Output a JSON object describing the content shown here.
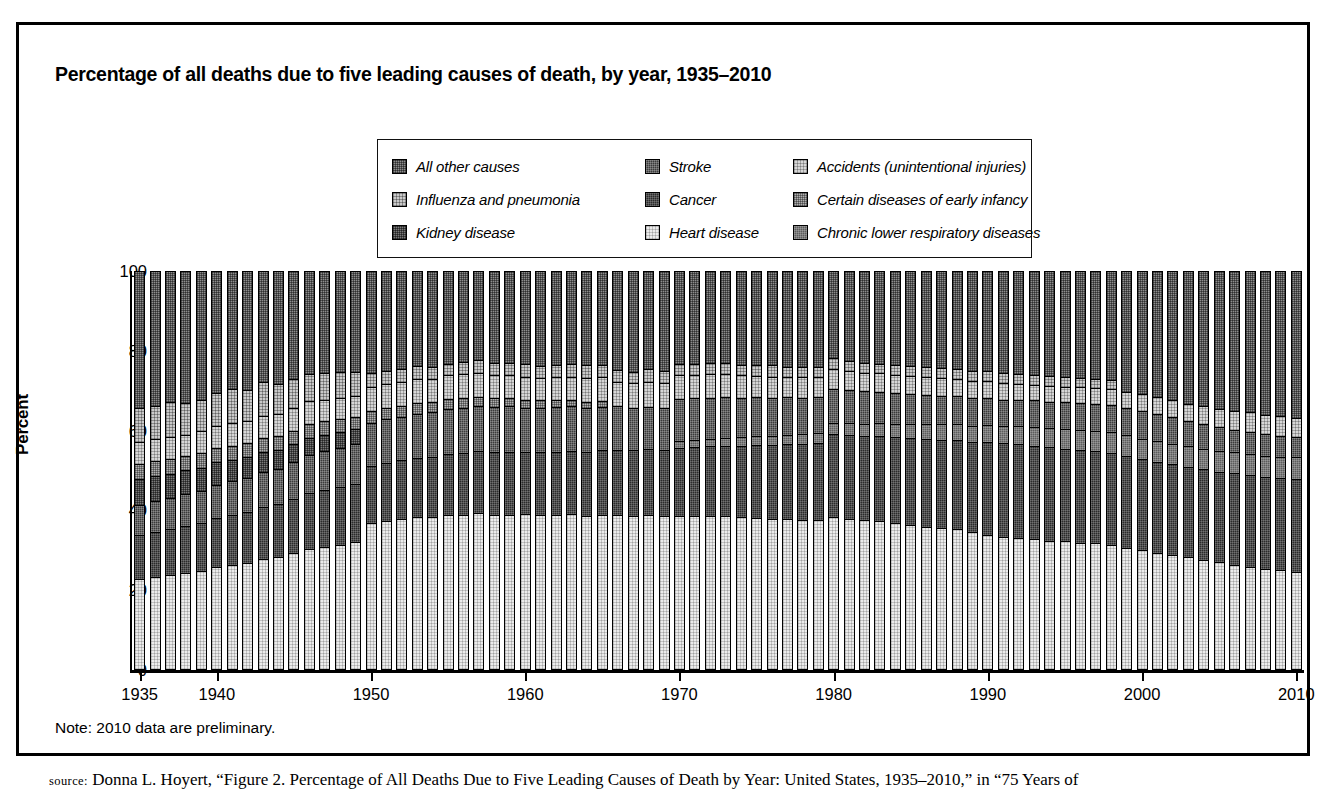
{
  "figure": {
    "title": "Percentage of all deaths due to five leading causes of death, by year, 1935–2010",
    "note": "Note: 2010 data are preliminary.",
    "source_prefix": "source:",
    "source_text": " Donna L. Hoyert, “Figure 2. Percentage of All Deaths Due to Five Leading Causes of Death by Year: United States, 1935–2010,” in “75 Years of",
    "page_header": ""
  },
  "legend": {
    "items": [
      {
        "label": "All other causes",
        "key": "allother",
        "pattern": "p-allother",
        "color": "#8d8d8d"
      },
      {
        "label": "Stroke",
        "key": "stroke",
        "pattern": "p-stroke",
        "color": "#3b3b3b"
      },
      {
        "label": "Accidents (unintentional injuries)",
        "key": "accidents",
        "pattern": "p-accidents",
        "color": "#d6d6d6"
      },
      {
        "label": "Influenza and pneumonia",
        "key": "influenza",
        "pattern": "p-influenza",
        "color": "#c9c9c9"
      },
      {
        "label": "Cancer",
        "key": "cancer",
        "pattern": "p-cancer",
        "color": "#2b2b2b"
      },
      {
        "label": "Certain diseases of early infancy",
        "key": "infancy",
        "pattern": "p-infancy",
        "color": "#b0b0b0"
      },
      {
        "label": "Kidney disease",
        "key": "kidney",
        "pattern": "p-kidney",
        "color": "#7a7a7a"
      },
      {
        "label": "Heart disease",
        "key": "heart",
        "pattern": "p-heart",
        "color": "#ebebeb"
      },
      {
        "label": "Chronic lower respiratory diseases",
        "key": "clrd",
        "pattern": "p-clrd",
        "color": "#5c5c5c"
      }
    ]
  },
  "chart_data": {
    "type": "bar",
    "stacked": true,
    "title": "Percentage of all deaths due to five leading causes of death, by year, 1935–2010",
    "xlabel": "",
    "ylabel": "Percent",
    "ylim": [
      0,
      100
    ],
    "yticks": [
      0,
      20,
      40,
      60,
      80,
      100
    ],
    "xtick_years": [
      1935,
      1940,
      1950,
      1960,
      1970,
      1980,
      1990,
      2000,
      2010
    ],
    "grid": false,
    "legend_position": "top-center",
    "x": [
      1935,
      1936,
      1937,
      1938,
      1939,
      1940,
      1941,
      1942,
      1943,
      1944,
      1945,
      1946,
      1947,
      1948,
      1949,
      1950,
      1951,
      1952,
      1953,
      1954,
      1955,
      1956,
      1957,
      1958,
      1959,
      1960,
      1961,
      1962,
      1963,
      1964,
      1965,
      1966,
      1967,
      1968,
      1969,
      1970,
      1971,
      1972,
      1973,
      1974,
      1975,
      1976,
      1977,
      1978,
      1979,
      1980,
      1981,
      1982,
      1983,
      1984,
      1985,
      1986,
      1987,
      1988,
      1989,
      1990,
      1991,
      1992,
      1993,
      1994,
      1995,
      1996,
      1997,
      1998,
      1999,
      2000,
      2001,
      2002,
      2003,
      2004,
      2005,
      2006,
      2007,
      2008,
      2009,
      2010
    ],
    "stack_order_bottom_to_top": [
      "heart",
      "cancer",
      "clrd",
      "stroke",
      "kidney",
      "infancy",
      "accidents",
      "influenza",
      "allother"
    ],
    "series": [
      {
        "name": "Heart disease",
        "key": "heart",
        "values": [
          22.5,
          23.0,
          23.5,
          24.0,
          24.5,
          25.5,
          26.0,
          26.5,
          27.5,
          28.0,
          29.0,
          30.0,
          30.5,
          31.0,
          32.0,
          36.5,
          37.0,
          37.5,
          38.0,
          38.0,
          38.5,
          38.5,
          39.0,
          38.5,
          38.5,
          38.7,
          38.5,
          38.6,
          38.7,
          38.3,
          38.6,
          38.6,
          38.3,
          38.4,
          38.2,
          38.3,
          38.3,
          38.3,
          38.2,
          38.0,
          37.8,
          37.6,
          37.5,
          37.3,
          37.2,
          38.0,
          37.6,
          37.2,
          36.9,
          36.4,
          36.0,
          35.6,
          35.2,
          34.9,
          34.3,
          33.5,
          33.1,
          32.8,
          32.6,
          32.1,
          31.9,
          31.5,
          31.4,
          31.0,
          30.3,
          29.6,
          29.0,
          28.5,
          28.0,
          27.2,
          26.6,
          26.0,
          25.4,
          25.0,
          24.6,
          24.2
        ]
      },
      {
        "name": "Cancer",
        "key": "cancer",
        "values": [
          11.0,
          11.3,
          11.5,
          11.8,
          12.0,
          12.3,
          12.5,
          12.7,
          13.0,
          13.2,
          13.5,
          14.0,
          14.3,
          14.5,
          14.7,
          14.5,
          14.7,
          14.8,
          15.0,
          15.2,
          15.4,
          15.6,
          15.6,
          15.8,
          16.0,
          15.6,
          15.8,
          15.9,
          16.0,
          16.1,
          16.2,
          16.4,
          16.5,
          16.6,
          16.8,
          17.2,
          17.4,
          17.6,
          17.8,
          18.0,
          18.4,
          18.6,
          18.9,
          19.1,
          19.4,
          20.9,
          21.1,
          21.3,
          21.5,
          21.7,
          21.9,
          22.1,
          22.3,
          22.4,
          22.5,
          23.4,
          23.5,
          23.6,
          23.4,
          23.5,
          23.3,
          23.4,
          23.2,
          23.2,
          23.0,
          23.0,
          22.9,
          22.8,
          22.7,
          22.8,
          22.8,
          23.1,
          23.2,
          23.1,
          23.3,
          23.3
        ]
      },
      {
        "name": "Chronic lower respiratory diseases",
        "key": "clrd",
        "values": [
          0,
          0,
          0,
          0,
          0,
          0,
          0,
          0,
          0,
          0,
          0,
          0,
          0,
          0,
          0,
          0,
          0,
          0,
          0,
          0,
          0,
          0,
          0,
          0,
          0,
          0,
          0,
          0,
          0,
          0,
          0,
          0,
          0,
          0,
          0,
          1.7,
          1.8,
          1.9,
          2.0,
          2.1,
          2.2,
          2.3,
          2.4,
          2.5,
          2.6,
          2.7,
          2.9,
          3.0,
          3.2,
          3.4,
          3.6,
          3.7,
          3.9,
          4.1,
          4.2,
          4.3,
          4.4,
          4.5,
          4.7,
          4.8,
          4.9,
          5.0,
          5.1,
          5.2,
          5.3,
          5.2,
          5.2,
          5.2,
          5.1,
          5.2,
          5.3,
          5.2,
          5.3,
          5.4,
          5.3,
          5.6
        ]
      },
      {
        "name": "Stroke",
        "key": "stroke",
        "values": [
          7.5,
          7.7,
          7.8,
          8.0,
          8.2,
          8.4,
          8.5,
          8.7,
          8.9,
          9.0,
          9.3,
          9.6,
          9.8,
          10.0,
          10.2,
          10.8,
          10.9,
          11.0,
          11.1,
          11.2,
          11.3,
          11.4,
          11.4,
          11.4,
          11.4,
          11.3,
          11.2,
          11.2,
          11.2,
          11.1,
          11.0,
          10.9,
          10.8,
          10.7,
          10.6,
          10.5,
          10.4,
          10.3,
          10.2,
          10.0,
          9.8,
          9.6,
          9.4,
          9.2,
          9.0,
          8.7,
          8.5,
          8.2,
          8.0,
          7.8,
          7.6,
          7.4,
          7.2,
          7.0,
          6.9,
          6.7,
          6.6,
          6.6,
          6.7,
          6.7,
          6.8,
          6.8,
          6.8,
          6.8,
          6.8,
          7.0,
          6.8,
          6.6,
          6.4,
          6.3,
          6.0,
          5.7,
          5.6,
          5.4,
          5.3,
          5.1
        ]
      },
      {
        "name": "Kidney disease",
        "key": "kidney",
        "values": [
          6.5,
          6.3,
          6.1,
          6.0,
          5.8,
          5.6,
          5.4,
          5.2,
          5.0,
          4.8,
          4.6,
          4.4,
          4.2,
          4.0,
          3.8,
          0,
          0,
          0,
          0,
          0,
          0,
          0,
          0,
          0,
          0,
          0,
          0,
          0,
          0,
          0,
          0,
          0,
          0,
          0,
          0,
          0,
          0,
          0,
          0,
          0,
          0,
          0,
          0,
          0,
          0,
          0,
          0,
          0,
          0,
          0,
          0,
          0,
          0,
          0,
          0,
          0,
          0,
          0,
          0,
          0,
          0,
          0,
          0,
          0,
          0,
          0,
          0,
          0,
          0,
          0,
          0,
          0,
          0,
          0,
          0,
          0
        ]
      },
      {
        "name": "Certain diseases of early infancy",
        "key": "infancy",
        "values": [
          4.0,
          3.9,
          3.8,
          3.7,
          3.7,
          3.6,
          3.6,
          3.5,
          3.5,
          3.4,
          3.4,
          3.4,
          3.3,
          3.2,
          3.1,
          3.0,
          2.9,
          2.8,
          2.7,
          2.6,
          2.5,
          2.4,
          2.3,
          2.2,
          2.1,
          2.0,
          1.9,
          1.8,
          1.7,
          1.6,
          1.5,
          0,
          0,
          0,
          0,
          0,
          0,
          0,
          0,
          0,
          0,
          0,
          0,
          0,
          0,
          0,
          0,
          0,
          0,
          0,
          0,
          0,
          0,
          0,
          0,
          0,
          0,
          0,
          0,
          0,
          0,
          0,
          0,
          0,
          0,
          0,
          0,
          0,
          0,
          0,
          0,
          0,
          0,
          0,
          0,
          0
        ]
      },
      {
        "name": "Accidents (unintentional injuries)",
        "key": "accidents",
        "values": [
          5.5,
          5.4,
          5.6,
          5.3,
          5.4,
          5.6,
          5.8,
          5.7,
          5.6,
          5.5,
          5.6,
          5.8,
          5.5,
          5.4,
          5.2,
          6.0,
          6.0,
          6.0,
          6.0,
          5.9,
          6.0,
          6.1,
          6.0,
          5.8,
          5.8,
          5.8,
          5.7,
          5.8,
          5.8,
          6.0,
          6.1,
          6.2,
          6.2,
          6.2,
          6.2,
          6.0,
          5.8,
          5.9,
          5.8,
          5.6,
          5.4,
          5.3,
          5.2,
          5.2,
          5.1,
          4.9,
          4.8,
          4.7,
          4.6,
          4.5,
          4.5,
          4.6,
          4.5,
          4.4,
          4.3,
          4.3,
          4.2,
          4.1,
          4.0,
          4.0,
          4.0,
          4.0,
          4.0,
          4.0,
          4.2,
          4.2,
          4.3,
          4.4,
          4.4,
          4.5,
          4.6,
          4.8,
          4.9,
          4.9,
          4.9,
          4.8
        ]
      },
      {
        "name": "Influenza and pneumonia",
        "key": "influenza",
        "values": [
          8.5,
          8.3,
          8.6,
          8.0,
          7.8,
          8.2,
          8.4,
          7.8,
          8.6,
          7.6,
          7.4,
          6.8,
          6.6,
          6.4,
          6.2,
          3.5,
          3.4,
          3.3,
          3.3,
          3.0,
          3.0,
          3.1,
          3.4,
          3.2,
          3.1,
          3.3,
          3.0,
          3.1,
          3.3,
          3.1,
          3.0,
          3.0,
          2.8,
          3.2,
          3.0,
          3.0,
          2.8,
          2.8,
          2.9,
          2.7,
          2.6,
          2.8,
          2.5,
          2.5,
          2.4,
          2.8,
          2.5,
          2.4,
          2.5,
          2.5,
          2.5,
          2.4,
          2.4,
          2.5,
          2.6,
          2.5,
          2.5,
          2.4,
          2.5,
          2.5,
          2.5,
          2.4,
          2.4,
          2.4,
          0,
          0,
          0,
          0,
          0,
          0,
          0,
          0,
          0,
          0,
          0,
          0
        ]
      },
      {
        "name": "All other causes",
        "key": "allother",
        "values": [
          34.5,
          34.1,
          33.1,
          33.2,
          32.6,
          30.8,
          29.8,
          29.9,
          27.9,
          28.5,
          27.2,
          26.0,
          25.8,
          25.5,
          25.6,
          25.7,
          25.1,
          24.6,
          23.9,
          24.1,
          23.3,
          22.9,
          22.3,
          23.1,
          23.1,
          23.3,
          23.9,
          23.6,
          23.3,
          23.8,
          23.6,
          24.9,
          25.4,
          24.7,
          25.2,
          23.3,
          23.5,
          23.2,
          23.1,
          23.6,
          23.8,
          23.8,
          24.1,
          24.2,
          24.3,
          22.0,
          22.6,
          23.2,
          23.3,
          23.7,
          23.9,
          24.2,
          24.5,
          24.7,
          25.2,
          25.3,
          25.7,
          26.0,
          26.1,
          26.4,
          26.6,
          26.9,
          27.1,
          27.4,
          30.4,
          31.0,
          31.8,
          32.5,
          33.4,
          34.0,
          34.7,
          35.2,
          35.6,
          36.2,
          36.6,
          37.0
        ]
      }
    ]
  }
}
